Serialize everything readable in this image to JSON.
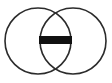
{
  "canvas": {
    "width": 112,
    "height": 83,
    "background_color": "#ffffff"
  },
  "icon": {
    "name": "boolean-subtract-icon",
    "title": "Subtract",
    "description": "Two overlapping circles with a horizontal minus bar in the intersection",
    "stroke_color": "#2b2b2b",
    "stroke_width": 1.6,
    "bar_color": "#111111"
  },
  "chart_data": {
    "type": "diagram",
    "subtype": "venn",
    "title": "Subtract",
    "shapes": [
      {
        "name": "left-circle",
        "type": "circle",
        "cx": 38,
        "cy": 41,
        "r": 33,
        "fill": "none",
        "stroke": "#2b2b2b"
      },
      {
        "name": "right-circle",
        "type": "circle",
        "cx": 73,
        "cy": 41,
        "r": 33,
        "fill": "none",
        "stroke": "#2b2b2b"
      },
      {
        "name": "minus-bar",
        "type": "rect",
        "x": 39,
        "y": 36,
        "width": 33,
        "height": 8,
        "fill": "#111111",
        "stroke": "none"
      }
    ],
    "intersection": {
      "top_point": [
        56,
        9
      ],
      "bottom_point": [
        56,
        72
      ],
      "center": [
        56,
        41
      ]
    },
    "bounds": {
      "left": 5,
      "right": 106,
      "top": 8,
      "bottom": 74
    },
    "grid": false,
    "legend": null
  }
}
